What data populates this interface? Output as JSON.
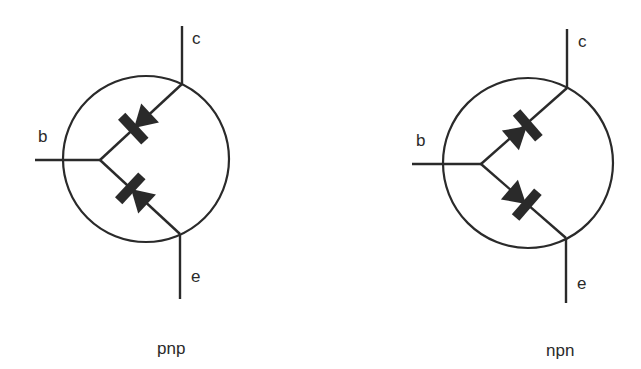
{
  "diagram": {
    "type": "transistor diode-equivalent models",
    "colors": {
      "ink": "#2a2a2a",
      "background": "#ffffff"
    },
    "symbols": [
      {
        "id": "pnp",
        "caption": "pnp",
        "terminals": {
          "base": "b",
          "collector": "c",
          "emitter": "e"
        },
        "diodes": [
          {
            "between": "base-collector",
            "anode": "collector",
            "cathode": "base",
            "icon": "diode-icon"
          },
          {
            "between": "base-emitter",
            "anode": "emitter",
            "cathode": "base",
            "icon": "diode-icon"
          }
        ]
      },
      {
        "id": "npn",
        "caption": "npn",
        "terminals": {
          "base": "b",
          "collector": "c",
          "emitter": "e"
        },
        "diodes": [
          {
            "between": "base-collector",
            "anode": "base",
            "cathode": "collector",
            "icon": "diode-icon"
          },
          {
            "between": "base-emitter",
            "anode": "base",
            "cathode": "emitter",
            "icon": "diode-icon"
          }
        ]
      }
    ]
  }
}
